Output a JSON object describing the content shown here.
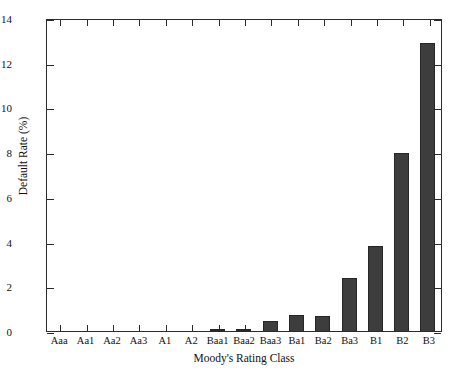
{
  "chart_data": {
    "type": "bar",
    "title": "",
    "xlabel": "Moody's Rating Class",
    "ylabel": "Default Rate (%)",
    "categories": [
      "Aaa",
      "Aa1",
      "Aa2",
      "Aa3",
      "A1",
      "A2",
      "Baa1",
      "Baa2",
      "Baa3",
      "Ba1",
      "Ba2",
      "Ba3",
      "B1",
      "B2",
      "B3"
    ],
    "values": [
      0.0,
      0.0,
      0.0,
      0.0,
      0.0,
      0.0,
      0.07,
      0.08,
      0.47,
      0.72,
      0.66,
      2.38,
      3.8,
      7.96,
      12.88
    ],
    "ylim": [
      0,
      14
    ],
    "yticks": [
      "0",
      "2",
      "4",
      "6",
      "8",
      "10",
      "12",
      "14"
    ],
    "ytick_values": [
      0,
      2,
      4,
      6,
      8,
      10,
      12,
      14
    ],
    "grid": false,
    "legend": "none",
    "bar_color": "#3d3d3d",
    "bar_edge_color": "#262626",
    "axis_color": "#2b2b2b",
    "background": "#ffffff"
  }
}
